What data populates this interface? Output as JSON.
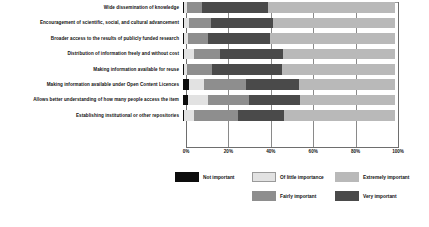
{
  "chart_data": {
    "type": "bar",
    "orientation": "horizontal",
    "stacked": true,
    "stack_mode": "percent",
    "title": "",
    "xlabel": "",
    "ylabel": "",
    "xlim": [
      0,
      100
    ],
    "xticks": [
      "0%",
      "20%",
      "40%",
      "60%",
      "80%",
      "100%"
    ],
    "xtick_values": [
      0,
      20,
      40,
      60,
      80,
      100
    ],
    "grid": true,
    "legend_position": "bottom",
    "categories": [
      "Wide dissemination of knowledge",
      "Encouragement of scientific, social, and cultural advancement",
      "Broader access to the results of publicly funded research",
      "Distribution of information freely and without cost",
      "Making information available for reuse",
      "Making information available under Open Content Licences",
      "Allows better understanding of how many people access the item",
      "Establishing institutional or other repositories"
    ],
    "series": [
      {
        "name": "Not important",
        "color": "#0d0d0d",
        "values": [
          0.5,
          0.5,
          0.5,
          0.5,
          0.5,
          3.0,
          2.5,
          0.5
        ]
      },
      {
        "name": "Of little importance",
        "color": "#e2e2e2",
        "values": [
          1.5,
          2.5,
          2.0,
          4.5,
          1.5,
          7.0,
          9.5,
          4.5
        ]
      },
      {
        "name": "Fairly important",
        "color": "#8e8e8e",
        "values": [
          7.0,
          10.0,
          9.5,
          12.5,
          11.5,
          19.5,
          19.0,
          21.0
        ]
      },
      {
        "name": "Very important",
        "color": "#4a4a4a",
        "values": [
          31.0,
          29.5,
          29.0,
          29.5,
          33.0,
          25.0,
          24.0,
          21.5
        ]
      },
      {
        "name": "Extremely important",
        "color": "#b9b9b9",
        "values": [
          60.0,
          57.5,
          59.0,
          53.0,
          53.5,
          45.5,
          45.0,
          52.5
        ]
      }
    ]
  },
  "legend": {
    "items": [
      {
        "label": "Not important",
        "color": "#0d0d0d"
      },
      {
        "label": "Of little importance",
        "color": "#e2e2e2"
      },
      {
        "label": "Extremely important",
        "color": "#b9b9b9"
      },
      {
        "label": "Fairly important",
        "color": "#8e8e8e"
      },
      {
        "label": "Very important",
        "color": "#4a4a4a"
      }
    ]
  }
}
